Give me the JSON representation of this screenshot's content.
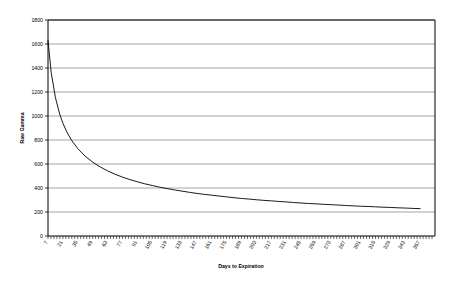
{
  "chart_data": {
    "type": "line",
    "title": "",
    "xlabel": "Days to Expiration",
    "ylabel": "Raw Gamma",
    "xlim": [
      7,
      357
    ],
    "ylim": [
      0,
      1800
    ],
    "grid": true,
    "legend": false,
    "y_ticks": [
      0,
      200,
      400,
      600,
      800,
      1000,
      1200,
      1400,
      1600,
      1800
    ],
    "x_tick_labels": [
      "7",
      "21",
      "35",
      "49",
      "63",
      "77",
      "91",
      "105",
      "119",
      "133",
      "147",
      "161",
      "175",
      "189",
      "203",
      "217",
      "231",
      "245",
      "259",
      "273",
      "287",
      "301",
      "315",
      "329",
      "343",
      "357"
    ],
    "series": [
      {
        "name": "Raw Gamma",
        "color": "#000000",
        "x": [
          7,
          10,
          14,
          18,
          21,
          25,
          29,
          35,
          42,
          49,
          56,
          63,
          70,
          77,
          84,
          91,
          98,
          105,
          112,
          119,
          126,
          133,
          140,
          147,
          154,
          161,
          168,
          175,
          182,
          189,
          196,
          203,
          210,
          217,
          224,
          231,
          238,
          245,
          252,
          259,
          266,
          273,
          280,
          287,
          294,
          301,
          308,
          315,
          322,
          329,
          336,
          343,
          350,
          357
        ],
        "y": [
          1629,
          1363,
          1152,
          1016,
          940,
          862,
          800,
          728,
          665,
          616,
          576,
          543,
          515,
          491,
          470,
          452,
          435,
          421,
          407,
          395,
          384,
          374,
          364,
          355,
          347,
          340,
          333,
          326,
          319,
          313,
          308,
          302,
          297,
          293,
          288,
          284,
          279,
          275,
          271,
          268,
          264,
          261,
          258,
          254,
          251,
          248,
          246,
          243,
          240,
          238,
          235,
          233,
          230,
          228
        ]
      }
    ]
  },
  "axes": {
    "y_axis_title": "Raw Gamma",
    "x_axis_title": "Days to Expiration"
  }
}
